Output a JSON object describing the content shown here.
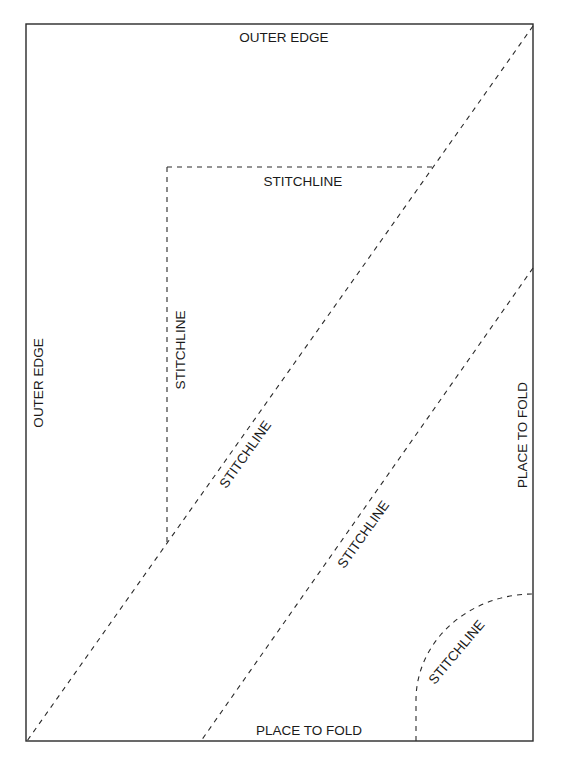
{
  "diagram": {
    "type": "sewing-pattern-piece",
    "labels": {
      "top_edge": "OUTER EDGE",
      "left_edge": "OUTER EDGE",
      "box_top_stitch": "STITCHLINE",
      "box_left_stitch": "STITCHLINE",
      "diagonal_1_stitch": "STITCHLINE",
      "diagonal_2_stitch": "STITCHLINE",
      "curve_stitch": "STITCHLINE",
      "right_fold": "PLACE TO FOLD",
      "bottom_fold": "PLACE TO FOLD"
    },
    "colors": {
      "line": "#2a2a2a",
      "text": "#1a1a1a",
      "background": "#ffffff"
    }
  }
}
